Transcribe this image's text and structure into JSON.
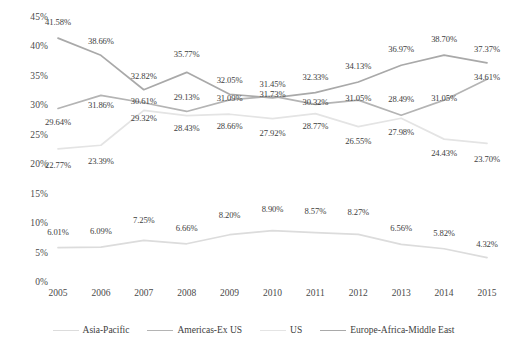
{
  "chart_data": {
    "type": "line",
    "title": "",
    "subtitle": "",
    "xlabel": "",
    "ylabel": "",
    "categories": [
      "2005",
      "2006",
      "2007",
      "2008",
      "2009",
      "2010",
      "2011",
      "2012",
      "2013",
      "2014",
      "2015"
    ],
    "ylim": [
      0,
      45
    ],
    "ytick_labels": [
      "45%",
      "40%",
      "35%",
      "30%",
      "25%",
      "20%",
      "15%",
      "10%",
      "5%",
      "0%"
    ],
    "ytick_values": [
      45,
      40,
      35,
      30,
      25,
      20,
      15,
      10,
      5,
      0
    ],
    "grid": false,
    "legend_position": "bottom",
    "value_labels_shown": true,
    "series": [
      {
        "name": "Asia-Pacific",
        "color": "#dcdcdc",
        "values": [
          6.01,
          6.09,
          7.25,
          6.66,
          8.2,
          8.9,
          8.57,
          8.27,
          6.56,
          5.82,
          4.32
        ],
        "labels": [
          "6.01%",
          "6.09%",
          "7.25%",
          "6.66%",
          "8.20%",
          "8.90%",
          "8.57%",
          "8.27%",
          "6.56%",
          "5.82%",
          "4.32%"
        ],
        "label_offsets_y": [
          -16,
          -16,
          -20,
          -16,
          -20,
          -22,
          -22,
          -22,
          -16,
          -16,
          -14
        ]
      },
      {
        "name": "Americas-Ex US",
        "color": "#b4b4b4",
        "values": [
          29.64,
          31.86,
          30.61,
          29.13,
          31.09,
          31.73,
          30.32,
          31.05,
          28.49,
          31.05,
          34.61
        ],
        "labels": [
          "29.64%",
          "31.86%",
          "30.61%",
          "29.13%",
          "31.09%",
          "31.73%",
          "30.32%",
          "31.05%",
          "28.49%",
          "31.05%",
          "34.61%"
        ],
        "label_offsets_y": [
          14,
          10,
          -2,
          -14,
          -2,
          -2,
          -2,
          -2,
          -16,
          -2,
          -2
        ]
      },
      {
        "name": "US",
        "color": "#e4e4e4",
        "values": [
          22.77,
          23.39,
          29.32,
          28.43,
          28.66,
          27.92,
          28.77,
          26.55,
          27.98,
          24.43,
          23.7
        ],
        "labels": [
          "22.77%",
          "23.39%",
          "29.32%",
          "28.43%",
          "28.66%",
          "27.92%",
          "28.77%",
          "26.55%",
          "27.98%",
          "24.43%",
          "23.70%"
        ],
        "label_offsets_y": [
          16,
          16,
          8,
          12,
          12,
          14,
          12,
          14,
          14,
          14,
          16
        ]
      },
      {
        "name": "Europe-Africa-Middle East",
        "color": "#a9a9a9",
        "values": [
          41.58,
          38.66,
          32.82,
          35.77,
          32.05,
          31.45,
          32.33,
          34.13,
          36.97,
          38.7,
          37.37
        ],
        "labels": [
          "41.58%",
          "38.66%",
          "32.82%",
          "35.77%",
          "32.05%",
          "31.45%",
          "32.33%",
          "34.13%",
          "36.97%",
          "38.70%",
          "37.37%"
        ],
        "label_offsets_y": [
          -16,
          -14,
          -14,
          -18,
          -14,
          -14,
          -16,
          -16,
          -16,
          -16,
          -14
        ]
      }
    ]
  },
  "legend": {
    "items": [
      {
        "label": "Asia-Pacific",
        "color": "#dcdcdc"
      },
      {
        "label": "Americas-Ex US",
        "color": "#b4b4b4"
      },
      {
        "label": "US",
        "color": "#e4e4e4"
      },
      {
        "label": "Europe-Africa-Middle East",
        "color": "#a9a9a9"
      }
    ]
  }
}
